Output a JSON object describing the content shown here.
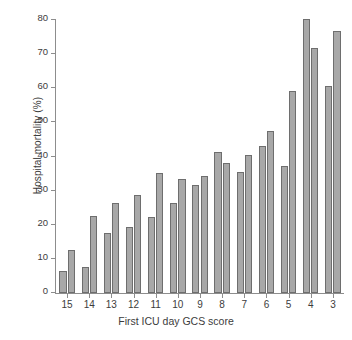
{
  "chart_data": {
    "type": "bar",
    "title": "",
    "xlabel": "First ICU day GCS score",
    "ylabel": "Hospital mortality (%)",
    "categories": [
      "15",
      "14",
      "13",
      "12",
      "11",
      "10",
      "9",
      "8",
      "7",
      "6",
      "5",
      "4",
      "3"
    ],
    "series": [
      {
        "name": "bar-1",
        "values": [
          6.5,
          7.5,
          17.7,
          19.4,
          22.2,
          26.5,
          31.7,
          41.3,
          35.5,
          43.0,
          37.3,
          80.3,
          60.8
        ]
      },
      {
        "name": "bar-2",
        "values": [
          12.5,
          22.5,
          26.3,
          28.7,
          35.3,
          33.4,
          34.3,
          38.2,
          40.3,
          47.6,
          59.2,
          71.8,
          76.9
        ]
      }
    ],
    "ylim": [
      0,
      80
    ],
    "yticks": [
      0,
      10,
      20,
      30,
      40,
      50,
      60,
      70,
      80
    ],
    "ytick_labels": [
      "0",
      "10",
      "20",
      "30",
      "40",
      "50",
      "60",
      "70",
      "80"
    ],
    "grid": false,
    "legend": "none",
    "bar_color": "#a8a8a8",
    "bar_edge_color": "#6e6e6e",
    "axis_color": "#8d8d8d",
    "background": "#ffffff"
  }
}
